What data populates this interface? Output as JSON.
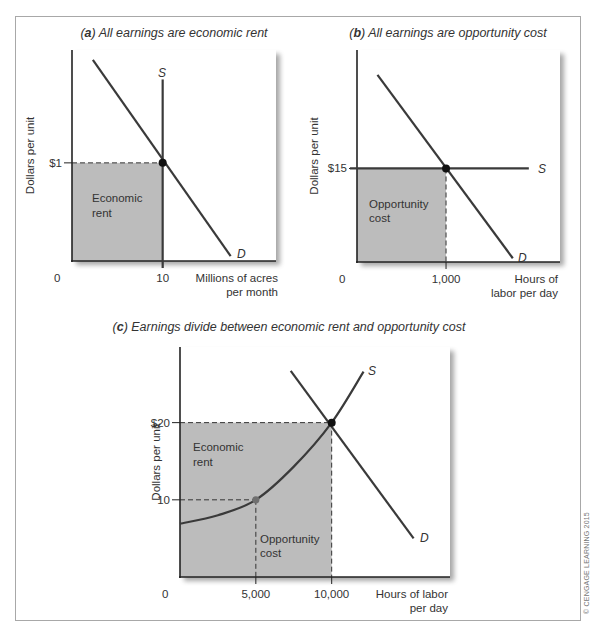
{
  "copyright": "© CENGAGE LEARNING 2015",
  "colors": {
    "shade": "#bcbcbc",
    "line": "#3a3a3a",
    "axis": "#222222",
    "point": "#111111",
    "point_secondary": "#6f6f6f"
  },
  "chart_data": [
    {
      "id": "a",
      "type": "line",
      "title_letter": "a",
      "title": "All earnings are economic rent",
      "xlabel": [
        "Millions of acres",
        "per month"
      ],
      "ylabel": "Dollars per unit",
      "origin_label": "0",
      "x_ticks": [
        {
          "value": 10,
          "label": "10"
        }
      ],
      "y_ticks": [
        {
          "value": 1,
          "label": "$1"
        }
      ],
      "xlim": [
        0,
        22.5
      ],
      "ylim": [
        0,
        2.15
      ],
      "series": [
        {
          "name": "S",
          "label": "S",
          "kind": "vertical",
          "points": [
            [
              10,
              0
            ],
            [
              10,
              1.85
            ]
          ]
        },
        {
          "name": "D",
          "label": "D",
          "kind": "linear",
          "points": [
            [
              2.3,
              2.05
            ],
            [
              17.5,
              0.05
            ]
          ]
        }
      ],
      "equilibrium": {
        "x": 10,
        "y": 1
      },
      "shaded_regions": [
        {
          "label": [
            "Economic",
            "rent"
          ],
          "x": [
            0,
            10
          ],
          "y": [
            0,
            1
          ]
        }
      ],
      "guides": [
        {
          "from": [
            0,
            1
          ],
          "to": [
            10,
            1
          ]
        }
      ]
    },
    {
      "id": "b",
      "type": "line",
      "title_letter": "b",
      "title": "All earnings are opportunity cost",
      "xlabel": [
        "Hours of",
        "labor per day"
      ],
      "ylabel": "Dollars per unit",
      "origin_label": "0",
      "x_ticks": [
        {
          "value": 1000,
          "label": "1,000"
        }
      ],
      "y_ticks": [
        {
          "value": 15,
          "label": "$15"
        }
      ],
      "xlim": [
        0,
        2280
      ],
      "ylim": [
        0,
        34
      ],
      "series": [
        {
          "name": "S",
          "label": "S",
          "kind": "horizontal",
          "points": [
            [
              0,
              15
            ],
            [
              1930,
              15
            ]
          ]
        },
        {
          "name": "D",
          "label": "D",
          "kind": "linear",
          "points": [
            [
              230,
              30
            ],
            [
              1750,
              0.6
            ]
          ]
        }
      ],
      "equilibrium": {
        "x": 1000,
        "y": 15
      },
      "shaded_regions": [
        {
          "label": [
            "Opportunity",
            "cost"
          ],
          "x": [
            0,
            1000
          ],
          "y": [
            0,
            15
          ]
        }
      ],
      "guides": [
        {
          "from": [
            1000,
            15
          ],
          "to": [
            1000,
            0
          ]
        }
      ]
    },
    {
      "id": "c",
      "type": "line",
      "title_letter": "c",
      "title": "Earnings divide between economic rent and opportunity cost",
      "xlabel": [
        "Hours of labor",
        "per day"
      ],
      "ylabel": "Dollars per unit",
      "origin_label": "0",
      "x_ticks": [
        {
          "value": 5000,
          "label": "5,000"
        },
        {
          "value": 10000,
          "label": "10,000"
        }
      ],
      "y_ticks": [
        {
          "value": 20,
          "label": "$20"
        },
        {
          "value": 10,
          "label": "10"
        }
      ],
      "xlim": [
        0,
        17800
      ],
      "ylim": [
        0,
        29.8
      ],
      "series": [
        {
          "name": "S",
          "label": "S",
          "kind": "curve",
          "points": [
            [
              0,
              6.9
            ],
            [
              2500,
              8.0
            ],
            [
              5000,
              10
            ],
            [
              7500,
              14.3
            ],
            [
              10000,
              20
            ],
            [
              12100,
              26.6
            ]
          ]
        },
        {
          "name": "D",
          "label": "D",
          "kind": "linear",
          "points": [
            [
              7300,
              26.7
            ],
            [
              15400,
              5
            ]
          ]
        }
      ],
      "equilibrium": {
        "x": 10000,
        "y": 20
      },
      "secondary_point": {
        "x": 5000,
        "y": 10
      },
      "shaded_regions": [
        {
          "label": [
            "Economic",
            "rent"
          ],
          "x": [
            0,
            10000
          ],
          "y": [
            0,
            20
          ]
        },
        {
          "label": [
            "Opportunity",
            "cost"
          ],
          "x": null,
          "y": null
        }
      ],
      "guides": [
        {
          "from": [
            0,
            20
          ],
          "to": [
            10000,
            20
          ]
        },
        {
          "from": [
            10000,
            20
          ],
          "to": [
            10000,
            0
          ]
        },
        {
          "from": [
            0,
            10
          ],
          "to": [
            5000,
            10
          ]
        },
        {
          "from": [
            5000,
            10
          ],
          "to": [
            5000,
            0
          ]
        }
      ]
    }
  ]
}
